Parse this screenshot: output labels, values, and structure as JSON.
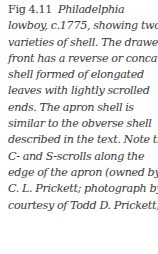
{
  "caption": {
    "figure_label": "Fig 4.11",
    "lines": [
      "Philadelphia",
      "lowboy, c.1775, showing two",
      "varieties of shell. The drawer",
      "front has a reverse or concave",
      "shell formed of elongated",
      "leaves with lightly scrolled",
      "ends. The apron shell is",
      "similar to the obverse shell",
      "described in the text. Note the",
      "C- and S-scrolls along the",
      "edge of the apron (owned by",
      "C. L. Prickett; photograph by",
      "courtesy of Todd D. Prickett)"
    ]
  }
}
